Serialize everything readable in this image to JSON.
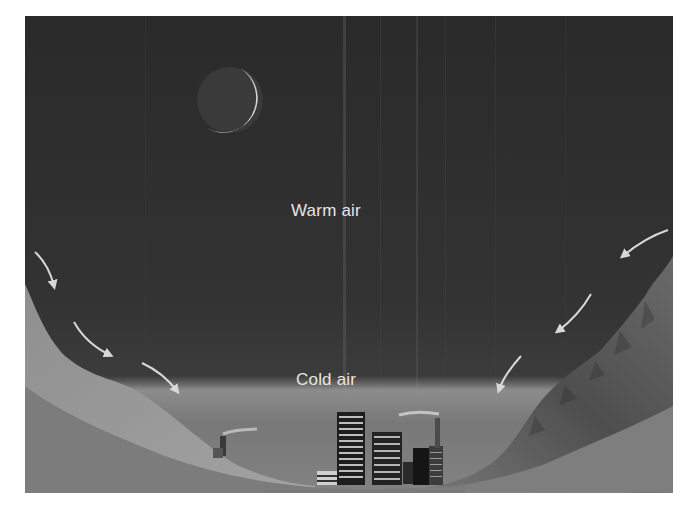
{
  "diagram": {
    "labels": {
      "warm_air": "Warm air",
      "cold_air": "Cold air"
    },
    "elements": {
      "moon": "crescent moon",
      "left_slope": "hillside",
      "right_slope": "rocky mountain",
      "city": "city buildings and smokestacks",
      "cold_layer": "hazy cold air layer",
      "arrows_left_count": 3,
      "arrows_right_count": 3
    },
    "colors": {
      "sky": "#2e2e2e",
      "ground": "#7a7a7a",
      "haze": "#8a8a8a",
      "text": "#e6e6e6",
      "arrow": "#d8d8d8"
    }
  }
}
